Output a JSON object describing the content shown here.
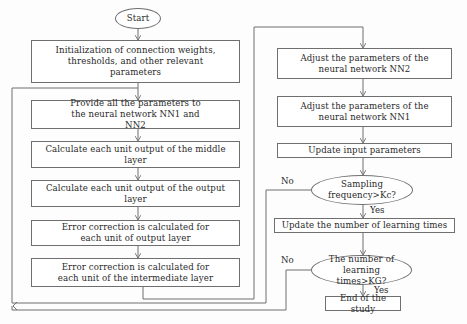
{
  "nodes": {
    "start": "Start",
    "init": "Initialization of connection weights, thresholds, and other relevant parameters",
    "provide": "Provide all the parameters to the neural network NN1 and NN2",
    "middle": "Calculate each unit output of the middle layer",
    "output": "Calculate each unit output of the output layer",
    "err_output": "Error correction is calculated for each unit of output layer",
    "err_intermediate": "Error correction is calculated for each unit of the intermediate layer",
    "adjust_nn2": "Adjust the parameters of the neural network NN2",
    "adjust_nn1": "Adjust the parameters of the neural network NN1",
    "update_input": "Update input parameters",
    "sampling": "Sampling frequency>Kc?",
    "update_learning": "Update the number of learning times",
    "learning_check": "The number of learning times>KG?",
    "end": "End of the study"
  },
  "edge_labels": {
    "sampling_no": "No",
    "sampling_yes": "Yes",
    "learning_no": "No",
    "learning_yes": "Yes"
  },
  "colors": {
    "line": "#6f6f6f",
    "box_border": "#6f6f6f",
    "text": "#2a2a2a",
    "background": "#fdfdfd"
  }
}
